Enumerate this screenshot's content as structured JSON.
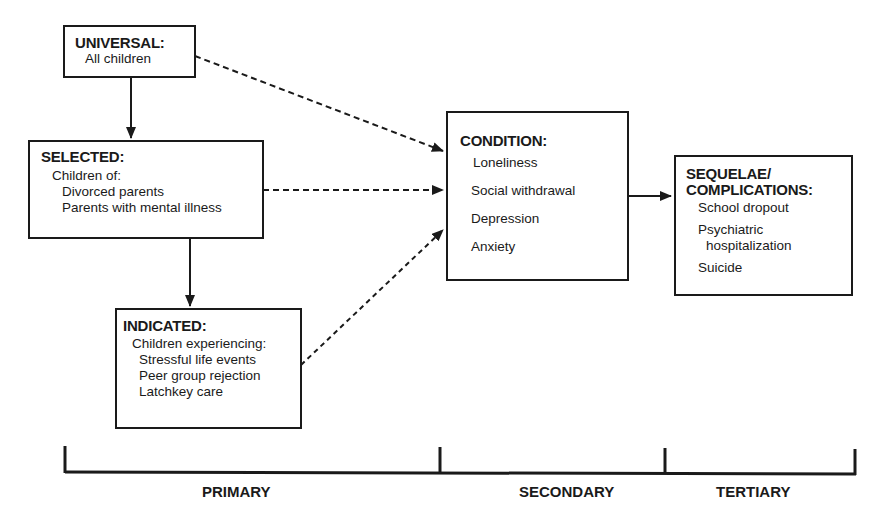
{
  "diagram": {
    "universal": {
      "title": "UNIVERSAL:",
      "lines": [
        "All children"
      ]
    },
    "selected": {
      "title": "SELECTED:",
      "lines": [
        "Children of:",
        "Divorced parents",
        "Parents with mental illness"
      ]
    },
    "indicated": {
      "title": "INDICATED:",
      "lines": [
        "Children experiencing:",
        "Stressful life events",
        "Peer group rejection",
        "Latchkey care"
      ]
    },
    "condition": {
      "title": "CONDITION:",
      "lines": [
        "Loneliness",
        "Social withdrawal",
        "Depression",
        "Anxiety"
      ]
    },
    "sequelae": {
      "title_line1": "SEQUELAE/",
      "title_line2": "COMPLICATIONS:",
      "lines": [
        "School dropout",
        "Psychiatric",
        "hospitalization",
        "Suicide"
      ]
    },
    "timeline": {
      "labels": [
        "PRIMARY",
        "SECONDARY",
        "TERTIARY"
      ]
    },
    "colors": {
      "ink": "#1a1a1a",
      "background": "#ffffff"
    }
  }
}
